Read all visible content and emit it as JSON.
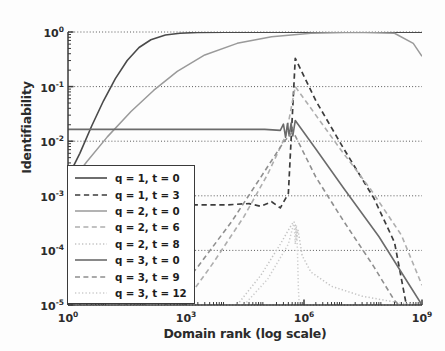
{
  "chart_data": {
    "type": "line",
    "title": "",
    "xlabel": "Domain rank (log scale)",
    "ylabel": "Identifiability",
    "xscale": "log",
    "yscale": "log",
    "xlim": [
      1,
      1000000000
    ],
    "ylim": [
      1e-05,
      1
    ],
    "xticks": [
      "10⁰",
      "10³",
      "10⁶",
      "10⁹"
    ],
    "xtick_values": [
      1,
      1000,
      1000000,
      1000000000
    ],
    "yticks": [
      "10⁰",
      "10⁻¹",
      "10⁻²",
      "10⁻³",
      "10⁻⁴",
      "10⁻⁵"
    ],
    "ytick_values": [
      1,
      0.1,
      0.01,
      0.001,
      0.0001,
      1e-05
    ],
    "grid": true,
    "grid_style": "dotted",
    "legend_position": "lower left",
    "series": [
      {
        "name": "q = 1, t = 0",
        "style": "solid",
        "color": "#4a4a4a",
        "width": 1.6,
        "points": [
          [
            1,
            0.0022
          ],
          [
            2,
            0.006
          ],
          [
            4,
            0.019
          ],
          [
            8,
            0.055
          ],
          [
            16,
            0.14
          ],
          [
            32,
            0.3
          ],
          [
            64,
            0.52
          ],
          [
            128,
            0.72
          ],
          [
            300,
            0.88
          ],
          [
            700,
            0.95
          ],
          [
            2000,
            0.98
          ],
          [
            10000,
            0.99
          ],
          [
            1000000,
            0.995
          ],
          [
            1000000000,
            0.995
          ]
        ]
      },
      {
        "name": "q = 1, t = 3",
        "style": "dashed",
        "color": "#3c3c3c",
        "width": 1.7,
        "points": [
          [
            1,
            0.00069
          ],
          [
            100,
            0.00069
          ],
          [
            10000,
            0.00068
          ],
          [
            40000,
            0.00072
          ],
          [
            80000,
            0.00064
          ],
          [
            150000,
            0.00078
          ],
          [
            250000,
            0.0006
          ],
          [
            400000,
            0.0011
          ],
          [
            600000,
            0.33
          ],
          [
            2000000,
            0.055
          ],
          [
            10000000,
            0.0075
          ],
          [
            60000000,
            0.0009
          ],
          [
            200000000,
            0.00014
          ],
          [
            400000000,
            1e-05
          ]
        ]
      },
      {
        "name": "q = 2, t = 0",
        "style": "solid",
        "color": "#9a9a9a",
        "width": 1.5,
        "points": [
          [
            1,
            0.0015
          ],
          [
            3,
            0.0042
          ],
          [
            10,
            0.012
          ],
          [
            40,
            0.035
          ],
          [
            150,
            0.085
          ],
          [
            600,
            0.19
          ],
          [
            3000,
            0.38
          ],
          [
            20000,
            0.62
          ],
          [
            150000,
            0.82
          ],
          [
            1500000,
            0.95
          ],
          [
            20000000,
            0.99
          ],
          [
            200000000,
            0.95
          ],
          [
            600000000,
            0.62
          ],
          [
            1000000000,
            0.36
          ]
        ]
      },
      {
        "name": "q = 2, t = 6",
        "style": "dashed",
        "color": "#aeaeae",
        "width": 1.6,
        "points": [
          [
            1000,
            1.2e-05
          ],
          [
            5000,
            6e-05
          ],
          [
            30000,
            0.00042
          ],
          [
            120000,
            0.0025
          ],
          [
            350000,
            0.013
          ],
          [
            600000,
            0.1
          ],
          [
            1500000,
            0.04
          ],
          [
            8000000,
            0.0075
          ],
          [
            50000000,
            0.0013
          ],
          [
            300000000,
            0.00019
          ],
          [
            1000000000,
            2.3e-05
          ]
        ]
      },
      {
        "name": "q = 2, t = 8",
        "style": "dotted",
        "color": "#c4c4c4",
        "width": 1.5,
        "points": [
          [
            20000,
            1e-05
          ],
          [
            80000,
            3.5e-05
          ],
          [
            250000,
            0.00013
          ],
          [
            500000,
            0.00031
          ],
          [
            600000,
            0.00029
          ],
          [
            650000,
            0.00016
          ],
          [
            700000,
            0.00024
          ],
          [
            900000,
            8e-05
          ],
          [
            1500000,
            4e-05
          ],
          [
            5000000,
            2.2e-05
          ],
          [
            30000000,
            1.45e-05
          ],
          [
            300000000,
            1.08e-05
          ],
          [
            1000000000,
            1e-05
          ]
        ]
      },
      {
        "name": "q = 3, t = 0",
        "style": "solid",
        "color": "#6b6b6b",
        "width": 1.6,
        "points": [
          [
            1,
            0.0165
          ],
          [
            10,
            0.0165
          ],
          [
            1000,
            0.0165
          ],
          [
            100000,
            0.0165
          ],
          [
            250000,
            0.0158
          ],
          [
            300000,
            0.0205
          ],
          [
            340000,
            0.0118
          ],
          [
            380000,
            0.021
          ],
          [
            420000,
            0.0125
          ],
          [
            470000,
            0.0215
          ],
          [
            520000,
            0.0125
          ],
          [
            600000,
            0.024
          ],
          [
            2000000,
            0.0072
          ],
          [
            10000000,
            0.0014
          ],
          [
            80000000,
            0.00018
          ],
          [
            500000000,
            2.2e-05
          ],
          [
            1000000000,
            1e-05
          ]
        ]
      },
      {
        "name": "q = 3, t = 9",
        "style": "dashed",
        "color": "#8f8f8f",
        "width": 1.6,
        "points": [
          [
            300,
            1e-05
          ],
          [
            2000,
            5e-05
          ],
          [
            15000,
            0.00035
          ],
          [
            80000,
            0.0022
          ],
          [
            300000,
            0.0095
          ],
          [
            500000,
            0.0145
          ],
          [
            600000,
            0.0125
          ],
          [
            2000000,
            0.0022
          ],
          [
            10000000,
            0.00035
          ],
          [
            60000000,
            5e-05
          ],
          [
            200000000,
            1.2e-05
          ],
          [
            260000000,
            1e-05
          ]
        ]
      },
      {
        "name": "q = 3, t = 12",
        "style": "dotted",
        "color": "#cdcdcd",
        "width": 1.5,
        "points": [
          [
            30000,
            1e-05
          ],
          [
            120000,
            3e-05
          ],
          [
            400000,
            0.00013
          ],
          [
            560000,
            0.00033
          ],
          [
            600000,
            0.00013
          ],
          [
            640000,
            0.00029
          ],
          [
            680000,
            0.000105
          ],
          [
            720000,
            2e-05
          ],
          [
            760000,
            1e-05
          ]
        ]
      }
    ]
  },
  "axes": {
    "y_axis_label": "Identifiability",
    "x_axis_label": "Domain rank (log scale)",
    "y_tick_labels": [
      {
        "base": "10",
        "exp": "0"
      },
      {
        "base": "10",
        "exp": "-1"
      },
      {
        "base": "10",
        "exp": "-2"
      },
      {
        "base": "10",
        "exp": "-3"
      },
      {
        "base": "10",
        "exp": "-4"
      },
      {
        "base": "10",
        "exp": "-5"
      }
    ],
    "x_tick_labels": [
      {
        "base": "10",
        "exp": "0"
      },
      {
        "base": "10",
        "exp": "3"
      },
      {
        "base": "10",
        "exp": "6"
      },
      {
        "base": "10",
        "exp": "9"
      }
    ]
  },
  "legend": {
    "entries": [
      {
        "label": "q = 1, t = 0"
      },
      {
        "label": "q = 1, t = 3"
      },
      {
        "label": "q = 2, t = 0"
      },
      {
        "label": "q = 2, t = 6"
      },
      {
        "label": "q = 2, t = 8"
      },
      {
        "label": "q = 3, t = 0"
      },
      {
        "label": "q = 3, t = 9"
      },
      {
        "label": "q = 3, t = 12"
      }
    ]
  }
}
